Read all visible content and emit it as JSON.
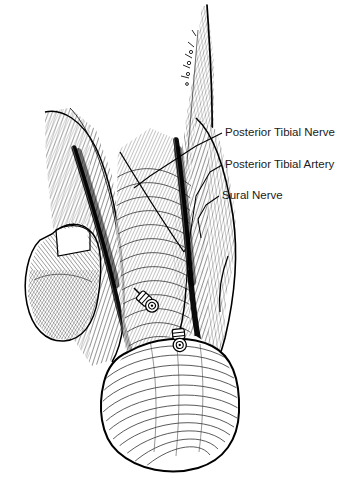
{
  "figure": {
    "style": "pen-and-ink line engraving",
    "ink_color": "#000000",
    "background_color": "#ffffff",
    "text_color": "#1a1a1a"
  },
  "labels": [
    {
      "id": "posterior-tibial-nerve",
      "text": "Posterior Tibial Nerve",
      "text_x": 225,
      "text_y": 126,
      "leader_points": "222,133 196,146 150,176 134,188"
    },
    {
      "id": "posterior-tibial-artery",
      "text": "Posterior Tibial Artery",
      "text_x": 225,
      "text_y": 158,
      "leader_points": "222,165 210,172 196,196 189,243 186,288"
    },
    {
      "id": "sural-nerve",
      "text": "Sural Nerve",
      "text_x": 222,
      "text_y": 189,
      "leader_points": "219,196 206,205 198,219 201,238"
    }
  ],
  "structures": [
    {
      "id": "achilles-tendon",
      "name": "Achilles tendon"
    },
    {
      "id": "lateral-malleolus",
      "name": "Lateral malleolus"
    },
    {
      "id": "calcaneal-heel",
      "name": "Calcaneal heel pad"
    },
    {
      "id": "medial-neurovascular-groove",
      "name": "Medial neurovascular groove"
    },
    {
      "id": "lateral-neurovascular-groove",
      "name": "Lateral neurovascular groove"
    },
    {
      "id": "nerve-stump-upper",
      "name": "Cut nerve stump, upper"
    },
    {
      "id": "nerve-stump-lower",
      "name": "Cut nerve stump, lower"
    }
  ]
}
